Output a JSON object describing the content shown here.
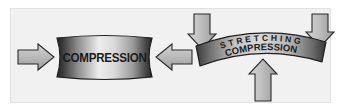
{
  "figure": {
    "background_color": "#ffffff",
    "panel_color": "#f1f1f1",
    "panel_border_color": "#e2e2e2",
    "arrow_fill": "#b4b4b4",
    "arrow_stroke": "#2a2a2a",
    "body_edge_color": "#2d2d2d",
    "body_light_color": "#f0f0f0",
    "body_mid_color": "#9a9a9a",
    "text_color": "#1b1b1b"
  },
  "left_diagram": {
    "name": "compression-block",
    "label": "COMPRESSION",
    "shape": "barrel",
    "arrows": [
      {
        "name": "left-compression-arrow",
        "direction": "right",
        "label": ""
      },
      {
        "name": "right-compression-arrow",
        "direction": "left",
        "label": ""
      }
    ]
  },
  "right_diagram": {
    "name": "beam-bending",
    "shape": "arch",
    "top_label": "S T R E T C H I N G",
    "top_label_plain": "STRETCHING",
    "bottom_label": "COMPRESSION",
    "arrows": [
      {
        "name": "top-left-load-arrow",
        "direction": "down",
        "label": ""
      },
      {
        "name": "top-right-load-arrow",
        "direction": "down",
        "label": ""
      },
      {
        "name": "bottom-center-support-arrow",
        "direction": "up",
        "label": ""
      }
    ]
  }
}
